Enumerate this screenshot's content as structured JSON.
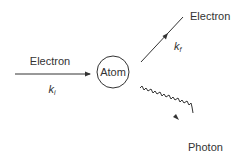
{
  "diagram": {
    "type": "scattering-diagram",
    "nodes": {
      "atom": {
        "label": "Atom"
      }
    },
    "incoming": {
      "label": "Electron",
      "momentum": "k",
      "momentum_sub": "i"
    },
    "outgoing_electron": {
      "label": "Electron",
      "momentum": "k",
      "momentum_sub": "f"
    },
    "outgoing_photon": {
      "label": "Photon"
    },
    "colors": {
      "stroke": "#333333",
      "background": "#ffffff"
    }
  }
}
